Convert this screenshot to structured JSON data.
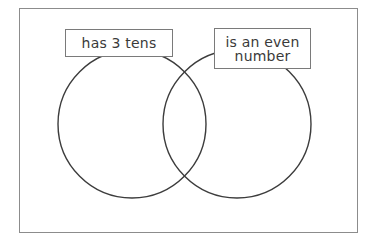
{
  "diagram": {
    "type": "venn",
    "sets": [
      {
        "id": "left",
        "label": "has 3 tens"
      },
      {
        "id": "right",
        "label_lines": [
          "is an even",
          "number"
        ]
      }
    ],
    "colors": {
      "frame_border": "#8c8c8c",
      "circle_stroke": "#3c3c3c",
      "label_border": "#7a7a7a",
      "text": "#3a3a3a",
      "background": "#ffffff"
    }
  }
}
